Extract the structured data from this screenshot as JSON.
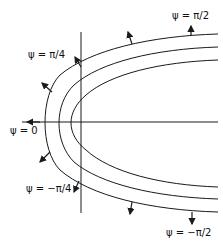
{
  "diagram": {
    "curves_count": 3,
    "labels": {
      "psi_pi_over_2": "ψ = π/2",
      "psi_pi_over_4": "ψ = π/4",
      "psi_zero": "ψ = 0",
      "psi_neg_pi_over_4": "ψ = −π/4",
      "psi_neg_pi_over_2": "ψ = −π/2"
    },
    "line_color": "#1a1a1a"
  }
}
